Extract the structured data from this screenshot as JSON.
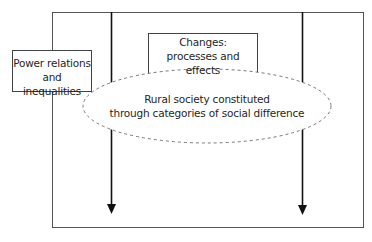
{
  "diagram": {
    "type": "conceptual-framework",
    "outer_frame": {
      "x": 52,
      "y": 12,
      "width": 311,
      "height": 216
    },
    "nodes": [
      {
        "id": "power",
        "label_lines": [
          "Power relations",
          "and inequalities"
        ],
        "shape": "rectangle"
      },
      {
        "id": "changes",
        "label_lines": [
          "Changes:",
          "processes and effects"
        ],
        "shape": "rectangle"
      },
      {
        "id": "rural",
        "label_lines": [
          "Rural society constituted",
          "through categories of social difference"
        ],
        "shape": "dashed-ellipse"
      }
    ],
    "arrows": [
      {
        "id": "left-arrow",
        "direction": "down"
      },
      {
        "id": "right-arrow",
        "direction": "down"
      }
    ]
  },
  "power": {
    "line1": "Power relations",
    "line2": "and inequalities"
  },
  "changes": {
    "line1": "Changes:",
    "line2": "processes and effects"
  },
  "rural": {
    "line1": "Rural society constituted",
    "line2": "through categories of social difference"
  },
  "colors": {
    "stroke": "#2a2a2a",
    "dashed": "#777777",
    "background": "#ffffff"
  }
}
